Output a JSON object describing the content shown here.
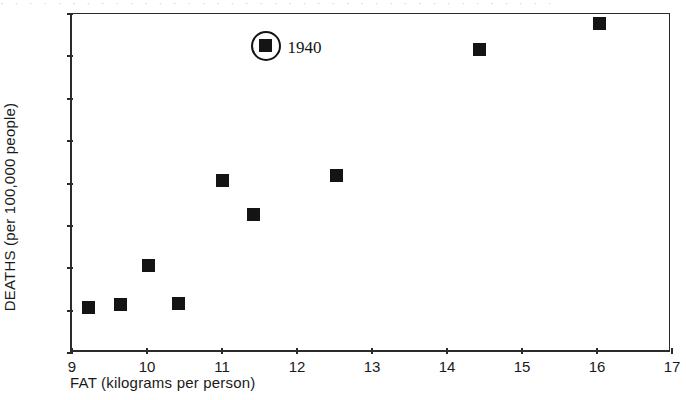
{
  "scan_artifact_text": "· · · · · · · · · · · · · · · · · · · · · · · · · · · · · · · · · · · · · · ·",
  "chart_data": {
    "type": "scatter",
    "title": "",
    "xlabel": "FAT (kilograms per person)",
    "ylabel": "DEATHS (per 100,000 people)",
    "xlim": [
      9,
      17
    ],
    "ylim": [
      22,
      30
    ],
    "xticks": [
      "9",
      "10",
      "11",
      "12",
      "13",
      "14",
      "15",
      "16",
      "17"
    ],
    "yticks": [
      "22",
      "23",
      "24",
      "25",
      "26",
      "27",
      "28",
      "29",
      "30"
    ],
    "xtick_values": [
      9,
      10,
      11,
      12,
      13,
      14,
      15,
      16,
      17
    ],
    "ytick_values": [
      22,
      23,
      24,
      25,
      26,
      27,
      28,
      29,
      30
    ],
    "grid": false,
    "legend": null,
    "marker": "filled-square",
    "marker_color": "#141414",
    "points": [
      {
        "x": 9.22,
        "y": 23.07
      },
      {
        "x": 9.65,
        "y": 23.15
      },
      {
        "x": 10.02,
        "y": 24.06
      },
      {
        "x": 10.42,
        "y": 23.16
      },
      {
        "x": 11.0,
        "y": 26.07
      },
      {
        "x": 11.42,
        "y": 25.28
      },
      {
        "x": 11.58,
        "y": 29.25
      },
      {
        "x": 12.52,
        "y": 26.2
      },
      {
        "x": 14.43,
        "y": 29.17
      },
      {
        "x": 16.03,
        "y": 29.78
      }
    ],
    "annotations": [
      {
        "label": "1940",
        "x": 11.58,
        "y": 29.25,
        "style": "circled-marker",
        "label_offset_x": 22,
        "label_offset_y": -7
      }
    ]
  }
}
